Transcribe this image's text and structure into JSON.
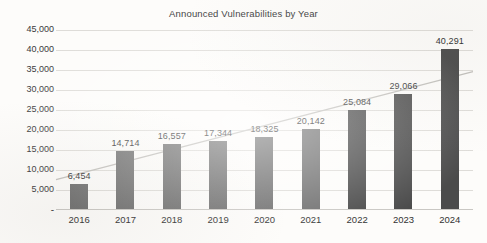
{
  "chart_data": {
    "type": "bar",
    "title": "Announced Vulnerabilities by Year",
    "xlabel": "",
    "ylabel": "",
    "categories": [
      "2016",
      "2017",
      "2018",
      "2019",
      "2020",
      "2021",
      "2022",
      "2023",
      "2024"
    ],
    "values": [
      6454,
      14714,
      16557,
      17344,
      18325,
      20142,
      25084,
      29066,
      40291
    ],
    "value_labels": [
      "6,454",
      "14,714",
      "16,557",
      "17,344",
      "18,325",
      "20,142",
      "25,084",
      "29,066",
      "40,291"
    ],
    "bar_colors": [
      "#6e6e6e",
      "#6e6e6e",
      "#6e6e6e",
      "#6e6e6e",
      "#6e6e6e",
      "#6e6e6e",
      "#4b4b4b",
      "#4b4b4b",
      "#4b4b4b"
    ],
    "ylim": [
      0,
      45000
    ],
    "ytick_values": [
      0,
      5000,
      10000,
      15000,
      20000,
      25000,
      30000,
      35000,
      40000,
      45000
    ],
    "ytick_labels": [
      "-",
      "5,000",
      "10,000",
      "15,000",
      "20,000",
      "25,000",
      "30,000",
      "35,000",
      "40,000",
      "45,000"
    ],
    "grid": "horizontal",
    "legend": "none",
    "overlay": {
      "type": "trendline",
      "style": "solid",
      "color": "#c2c0bc",
      "start_value": 7600,
      "end_value": 34600
    },
    "colors": {
      "background": "#fdfcfa",
      "gridline": "#dedcd8",
      "axis": "#c9c7c3",
      "title_text": "#3b3b3b",
      "tick_text": "#3a3a3a",
      "label_text": "#2f2f2f"
    }
  }
}
